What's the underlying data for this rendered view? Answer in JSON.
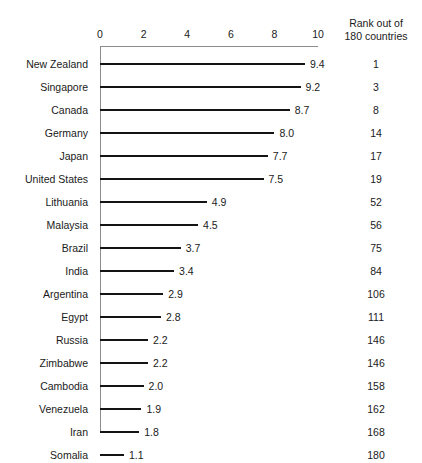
{
  "chart_data": {
    "type": "bar",
    "orientation": "horizontal",
    "title": "",
    "subtitle": "",
    "xlabel": "",
    "ylabel": "",
    "xlim": [
      0,
      10
    ],
    "grid": false,
    "legend": false,
    "axis_ticks": [
      "0",
      "2",
      "4",
      "6",
      "8",
      "10"
    ],
    "axis_tick_values": [
      0,
      2,
      4,
      6,
      8,
      10
    ],
    "categories": [
      "New Zealand",
      "Singapore",
      "Canada",
      "Germany",
      "Japan",
      "United States",
      "Lithuania",
      "Malaysia",
      "Brazil",
      "India",
      "Argentina",
      "Egypt",
      "Russia",
      "Zimbabwe",
      "Cambodia",
      "Venezuela",
      "Iran",
      "Somalia"
    ],
    "values": [
      9.4,
      9.2,
      8.7,
      8.0,
      7.7,
      7.5,
      4.9,
      4.5,
      3.7,
      3.4,
      2.9,
      2.8,
      2.2,
      2.2,
      2.0,
      1.9,
      1.8,
      1.1
    ],
    "value_labels": [
      "9.4",
      "9.2",
      "8.7",
      "8.0",
      "7.7",
      "7.5",
      "4.9",
      "4.5",
      "3.7",
      "3.4",
      "2.9",
      "2.8",
      "2.2",
      "2.2",
      "2.0",
      "1.9",
      "1.8",
      "1.1"
    ],
    "annotation_column": {
      "header_line1": "Rank out of",
      "header_line2": "180 countries",
      "values": [
        "1",
        "3",
        "8",
        "14",
        "17",
        "19",
        "52",
        "56",
        "75",
        "84",
        "106",
        "111",
        "146",
        "146",
        "158",
        "162",
        "168",
        "180"
      ]
    },
    "colors": {
      "bar": "#141414",
      "axis": "#8c8c8c",
      "text": "#1a1a1a",
      "background": "#ffffff"
    }
  }
}
